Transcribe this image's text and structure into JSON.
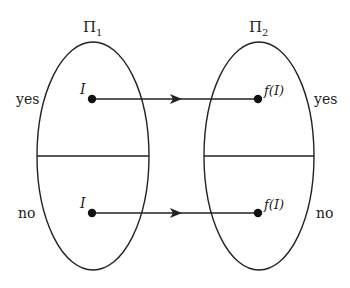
{
  "diagram": {
    "left_set": {
      "name": "Π",
      "subscript": "1",
      "yes_label": "yes",
      "no_label": "no",
      "top_instance": "I",
      "bottom_instance": "I"
    },
    "right_set": {
      "name": "Π",
      "subscript": "2",
      "yes_label": "yes",
      "no_label": "no",
      "top_image": "f(I)",
      "bottom_image": "f(I)"
    },
    "colors": {
      "stroke": "#222222",
      "background": "#ffffff"
    }
  }
}
